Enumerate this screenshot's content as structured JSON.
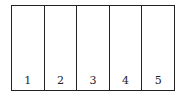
{
  "strip": {
    "cells": [
      {
        "label": "1"
      },
      {
        "label": "2"
      },
      {
        "label": "3"
      },
      {
        "label": "4"
      },
      {
        "label": "5"
      }
    ]
  }
}
